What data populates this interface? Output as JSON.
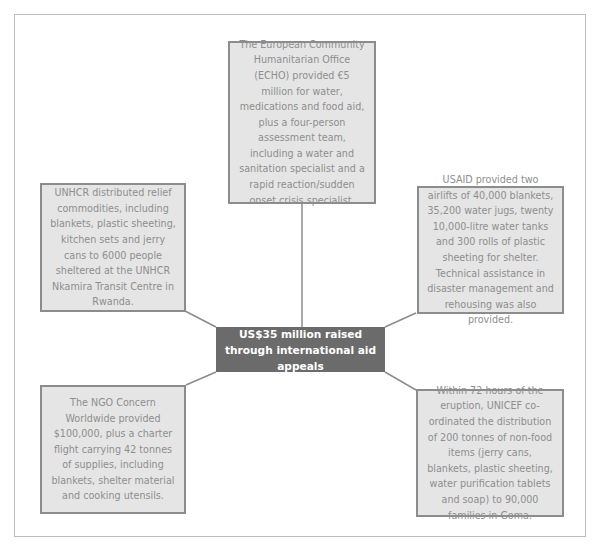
{
  "diagram": {
    "central_node": {
      "text": "US$35 million raised through international aid appeals",
      "fill": "#6b6b6b",
      "text_color": "#ffffff"
    },
    "nodes": [
      {
        "id": "echo",
        "position": "top",
        "text": "The European Community Humanitarian Office (ECHO) provided €5 million for water, medications and food aid, plus a four-person assessment team, including a water and sanitation specialist and a rapid reaction/sudden onset crisis specialist."
      },
      {
        "id": "unhcr",
        "position": "upper-left",
        "text": "UNHCR distributed relief commodities, including blankets, plastic sheeting, kitchen sets and jerry cans to 6000 people sheltered at the UNHCR Nkamira Transit Centre in Rwanda."
      },
      {
        "id": "usaid",
        "position": "upper-right",
        "text": "USAID provided two airlifts of 40,000 blankets, 35,200 water jugs, twenty 10,000-litre water tanks and 300 rolls of plastic sheeting for shelter. Technical assistance in disaster management and rehousing was also provided."
      },
      {
        "id": "concern",
        "position": "lower-left",
        "text": "The NGO Concern Worldwide provided $100,000, plus a charter flight carrying 42 tonnes of supplies, including blankets, shelter material and cooking utensils."
      },
      {
        "id": "unicef",
        "position": "lower-right",
        "text": "Within 72 hours of the eruption, UNICEF co-ordinated the distribution of 200 tonnes of non-food items (jerry cans, blankets, plastic sheeting, water purification tablets and soap) to 90,000 families in Goma."
      }
    ],
    "colors": {
      "node_fill": "#e5e5e5",
      "node_border": "#8c8c8c",
      "node_text": "#8e8e8e",
      "connector": "#8c8c8c",
      "frame_border": "#bdbdbd"
    }
  }
}
